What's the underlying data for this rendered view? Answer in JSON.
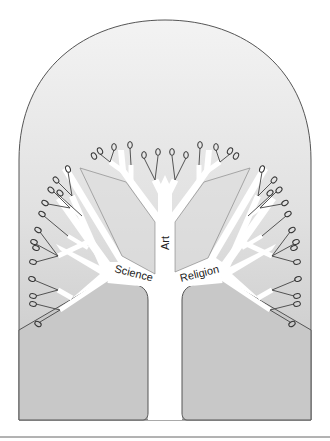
{
  "diagram": {
    "type": "tree-of-knowledge",
    "labels": {
      "left_branch": "Science",
      "center_branch": "Art",
      "right_branch": "Religion"
    },
    "colors": {
      "background_top": "#f2f2f2",
      "background_bottom": "#c4c4c4",
      "outline": "#555555",
      "trunk_fill": "#ffffff",
      "leaf_stroke": "#333333"
    },
    "leaf_count": 44
  }
}
